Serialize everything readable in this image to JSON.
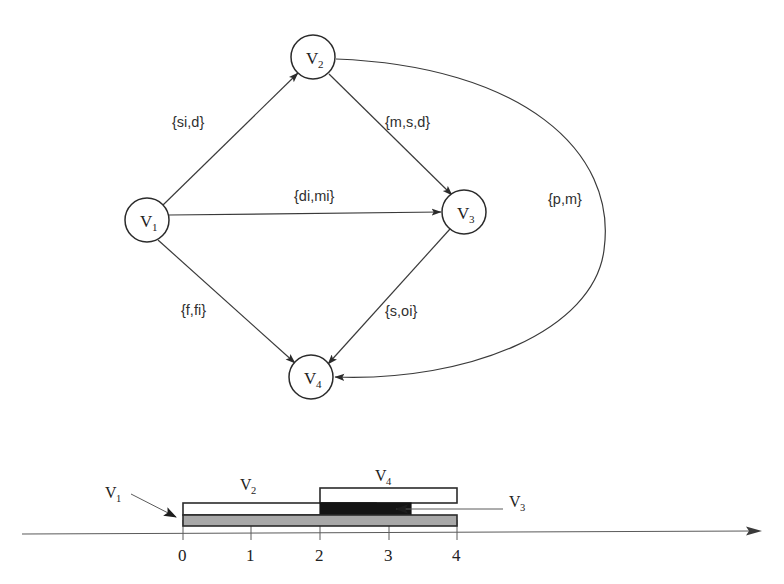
{
  "figure": {
    "title": "",
    "graph": {
      "nodes": [
        {
          "id": "V1",
          "label": "V",
          "sub": "1",
          "cx": 147,
          "cy": 220,
          "r": 22
        },
        {
          "id": "V2",
          "label": "V",
          "sub": "2",
          "cx": 313,
          "cy": 57,
          "r": 22
        },
        {
          "id": "V3",
          "label": "V",
          "sub": "3",
          "cx": 464,
          "cy": 212,
          "r": 22
        },
        {
          "id": "V4",
          "label": "V",
          "sub": "4",
          "cx": 311,
          "cy": 377,
          "r": 22
        }
      ],
      "edges": [
        {
          "from": "V1",
          "to": "V2",
          "label": "{si,d}",
          "lx": 172,
          "ly": 127
        },
        {
          "from": "V2",
          "to": "V3",
          "label": "{m,s,d}",
          "lx": 385,
          "ly": 127
        },
        {
          "from": "V1",
          "to": "V3",
          "label": "{di,mi}",
          "lx": 294,
          "ly": 201
        },
        {
          "from": "V1",
          "to": "V4",
          "label": "{f,fi}",
          "lx": 181,
          "ly": 315
        },
        {
          "from": "V3",
          "to": "V4",
          "label": "{s,oi}",
          "lx": 385,
          "ly": 316
        },
        {
          "from": "V2",
          "to": "V4",
          "label": "{p,m}",
          "lx": 548,
          "ly": 204,
          "curved": true
        }
      ]
    },
    "timeline": {
      "axis": {
        "y": 533,
        "x_start": 22,
        "x_end": 760,
        "origin_x": 183,
        "unit_px": 68.5,
        "ticks": [
          "0",
          "1",
          "2",
          "3",
          "4"
        ],
        "tick_label_y": 557
      },
      "intervals": [
        {
          "id": "V2",
          "label": "V",
          "sub": "2",
          "start": 0,
          "end": 2.81,
          "fill": "#ffffff",
          "y": 503,
          "h": 12,
          "label_x": 246,
          "label_y": 489
        },
        {
          "id": "V1",
          "label": "V",
          "sub": "1",
          "start": 0,
          "end": 4,
          "fill": "#a8a8a8",
          "y": 515,
          "h": 11,
          "label_x": 112,
          "label_y": 498
        },
        {
          "id": "V4",
          "label": "V",
          "sub": "4",
          "start": 2,
          "end": 4,
          "fill": "#ffffff",
          "y": 489,
          "h": 14,
          "label_x": 382,
          "label_y": 481
        },
        {
          "id": "V3",
          "label": "V",
          "sub": "3",
          "start": 2,
          "end": 3.32,
          "fill": "#141414",
          "y": 503,
          "h": 12,
          "label_x": 511,
          "label_y": 506
        }
      ],
      "callouts": [
        {
          "id": "V1",
          "from_x": 128,
          "from_y": 498,
          "to_x": 180,
          "to_y": 518
        },
        {
          "id": "V3",
          "from_x": 505,
          "from_y": 511,
          "to_x": 390,
          "to_y": 511
        }
      ]
    },
    "colors": {
      "line": "#3a3a3a",
      "node_stroke": "#2b2b2b",
      "v1_fill": "#a8a8a8",
      "v3_fill": "#141414",
      "bar_outline": "#2b2b2b",
      "background": "#ffffff"
    }
  }
}
